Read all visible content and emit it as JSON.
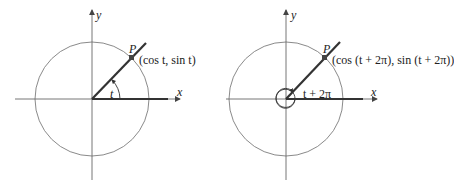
{
  "diagrams": [
    {
      "id": "left",
      "axis_x_label": "x",
      "axis_y_label": "y",
      "point_label": "P",
      "coord_label": "(cos t, sin t)",
      "angle_label": "t"
    },
    {
      "id": "right",
      "axis_x_label": "x",
      "axis_y_label": "y",
      "point_label": "P",
      "coord_label": "(cos (t + 2π), sin (t + 2π))",
      "angle_label": "t + 2π"
    }
  ],
  "colors": {
    "circle": "#8a8a8a",
    "axis": "#555555",
    "ray": "#333333",
    "point": "#444444"
  }
}
